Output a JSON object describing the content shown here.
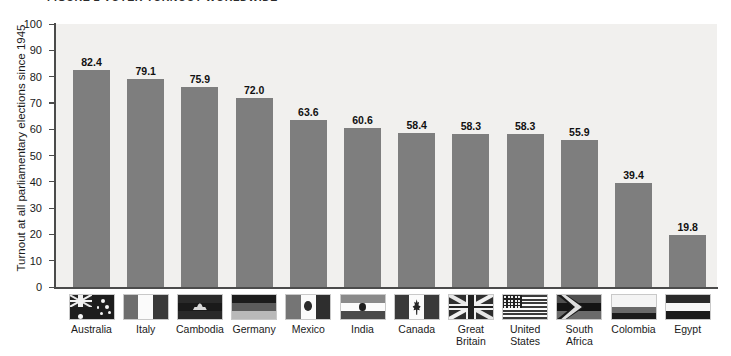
{
  "figure": {
    "title": "FIGURE 2   VOTER TURNOUT WORLDWIDE"
  },
  "chart_data": {
    "type": "bar",
    "title": "FIGURE 2   VOTER TURNOUT WORLDWIDE",
    "xlabel": "",
    "ylabel": "Turnout at all parliamentary elections since 1945",
    "ylim": [
      0,
      100
    ],
    "yticks": [
      "0",
      "10",
      "20",
      "30",
      "40",
      "50",
      "60",
      "70",
      "80",
      "90",
      "100"
    ],
    "grid": false,
    "legend": "none",
    "bar_color": "#7e7e7e",
    "plot_background": "#f1f0ee",
    "categories": [
      "Australia",
      "Italy",
      "Cambodia",
      "Germany",
      "Mexico",
      "India",
      "Canada",
      "Great Britain",
      "United States",
      "South Africa",
      "Colombia",
      "Egypt"
    ],
    "values": [
      82.4,
      79.1,
      75.9,
      72.0,
      63.6,
      60.6,
      58.4,
      58.3,
      58.3,
      55.9,
      39.4,
      19.8
    ],
    "value_labels": [
      "82.4",
      "79.1",
      "75.9",
      "72.0",
      "63.6",
      "60.6",
      "58.4",
      "58.3",
      "58.3",
      "55.9",
      "39.4",
      "19.8"
    ],
    "category_label_lines": [
      [
        "Australia"
      ],
      [
        "Italy"
      ],
      [
        "Cambodia"
      ],
      [
        "Germany"
      ],
      [
        "Mexico"
      ],
      [
        "India"
      ],
      [
        "Canada"
      ],
      [
        "Great",
        "Britain"
      ],
      [
        "United",
        "States"
      ],
      [
        "South",
        "Africa"
      ],
      [
        "Colombia"
      ],
      [
        "Egypt"
      ]
    ],
    "flag_icons": [
      "flag-australia-icon",
      "flag-italy-icon",
      "flag-cambodia-icon",
      "flag-germany-icon",
      "flag-mexico-icon",
      "flag-india-icon",
      "flag-canada-icon",
      "flag-great-britain-icon",
      "flag-united-states-icon",
      "flag-south-africa-icon",
      "flag-colombia-icon",
      "flag-egypt-icon"
    ]
  }
}
